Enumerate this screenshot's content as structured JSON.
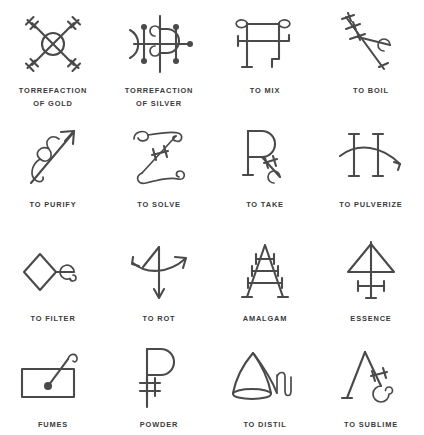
{
  "page": {
    "background_color": "#ffffff",
    "stroke_color": "#4a4a4a",
    "text_color": "#3a3a3a",
    "columns": 4,
    "rows": 4
  },
  "symbols": [
    {
      "id": "torrefaction-of-gold",
      "label": "TORREFACTION\nOF GOLD",
      "icon": "torrefaction-of-gold-icon",
      "row": 1,
      "col": 1
    },
    {
      "id": "torrefaction-of-silver",
      "label": "TORREFACTION\nOF SILVER",
      "icon": "torrefaction-of-silver-icon",
      "row": 1,
      "col": 2
    },
    {
      "id": "to-mix",
      "label": "TO MIX",
      "icon": "to-mix-icon",
      "row": 1,
      "col": 3
    },
    {
      "id": "to-boil",
      "label": "TO BOIL",
      "icon": "to-boil-icon",
      "row": 1,
      "col": 4
    },
    {
      "id": "to-purify",
      "label": "TO PURIFY",
      "icon": "to-purify-icon",
      "row": 2,
      "col": 1
    },
    {
      "id": "to-solve",
      "label": "TO SOLVE",
      "icon": "to-solve-icon",
      "row": 2,
      "col": 2
    },
    {
      "id": "to-take",
      "label": "TO TAKE",
      "icon": "to-take-icon",
      "row": 2,
      "col": 3
    },
    {
      "id": "to-pulverize",
      "label": "TO PULVERIZE",
      "icon": "to-pulverize-icon",
      "row": 2,
      "col": 4
    },
    {
      "id": "to-filter",
      "label": "TO FILTER",
      "icon": "to-filter-icon",
      "row": 3,
      "col": 1
    },
    {
      "id": "to-rot",
      "label": "TO ROT",
      "icon": "to-rot-icon",
      "row": 3,
      "col": 2
    },
    {
      "id": "amalgam",
      "label": "AMALGAM",
      "icon": "amalgam-icon",
      "row": 3,
      "col": 3
    },
    {
      "id": "essence",
      "label": "ESSENCE",
      "icon": "essence-icon",
      "row": 3,
      "col": 4
    },
    {
      "id": "fumes",
      "label": "FUMES",
      "icon": "fumes-icon",
      "row": 4,
      "col": 1
    },
    {
      "id": "powder",
      "label": "POWDER",
      "icon": "powder-icon",
      "row": 4,
      "col": 2
    },
    {
      "id": "to-distil",
      "label": "TO DISTIL",
      "icon": "to-distil-icon",
      "row": 4,
      "col": 3
    },
    {
      "id": "to-sublime",
      "label": "TO SUBLIME",
      "icon": "to-sublime-icon",
      "row": 4,
      "col": 4
    }
  ]
}
